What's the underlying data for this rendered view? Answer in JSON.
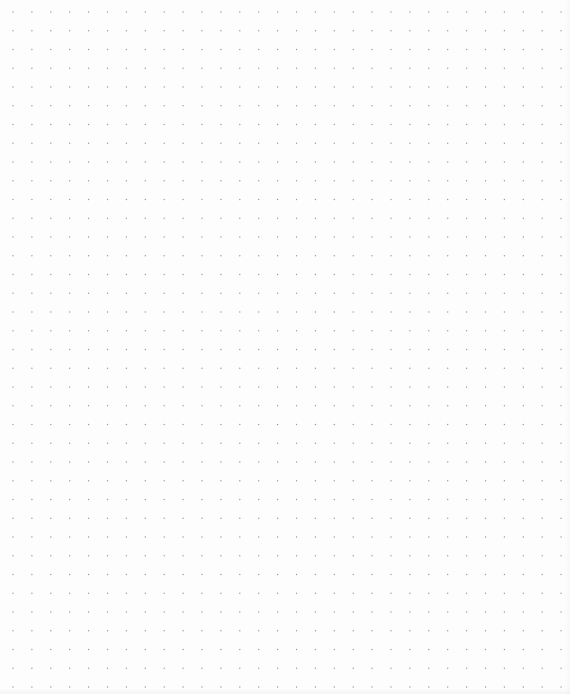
{
  "page": {
    "background_color": "#fdfdfd",
    "width": 570,
    "height": 694
  },
  "dot_grid": {
    "dot_color": "#9a9a9a",
    "dot_radius": 0.7,
    "origin_x": 13,
    "origin_y": 12,
    "spacing_x": 18.9,
    "spacing_y": 18.75,
    "columns": 30,
    "rows": 37
  }
}
